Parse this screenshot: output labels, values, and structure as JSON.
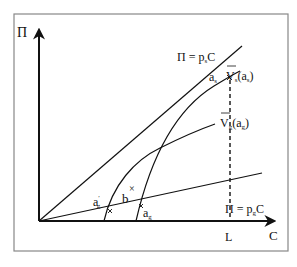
{
  "diagram": {
    "axes": {
      "y_label": "Π",
      "x_label": "C"
    },
    "lines": {
      "ps_line_label": "Π = p",
      "ps_sub": "s",
      "ps_tail": "C",
      "pg_line_label": "Π = p",
      "pg_sub": "g",
      "pg_tail": "C"
    },
    "curves": {
      "vs_label_main": "V",
      "vs_label_sub": "s",
      "vs_label_arg": "(a",
      "vs_label_arg_sub": "s",
      "vs_label_close": ")",
      "vg_label_main": "V",
      "vg_label_sub": "g",
      "vg_label_arg": "(a",
      "vg_label_arg_sub": "g",
      "vg_label_close": ")"
    },
    "points": {
      "as_main": "a",
      "as_sub": "s",
      "ag_main": "a",
      "ag_sub": "g",
      "agp_main": "a",
      "agp_sub": "g",
      "agp_prime": "′",
      "b_label": "b",
      "b_marker": "×"
    },
    "markers": {
      "L_label": "L"
    },
    "colors": {
      "line": "#111111",
      "frame": "#888888"
    }
  }
}
